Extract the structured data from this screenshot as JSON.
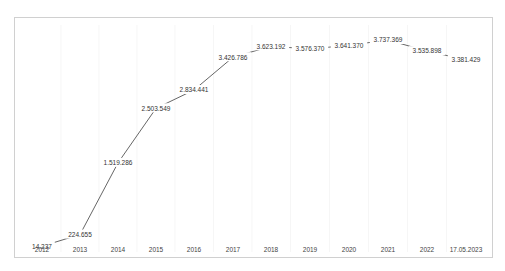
{
  "chart_data": {
    "type": "line",
    "title": "",
    "xlabel": "",
    "ylabel": "",
    "categories": [
      "2012",
      "2013",
      "2014",
      "2015",
      "2016",
      "2017",
      "2018",
      "2019",
      "2020",
      "2021",
      "2022",
      "17.05.2023"
    ],
    "series": [
      {
        "name": "",
        "values": [
          14237,
          224655,
          1519286,
          2503549,
          2834441,
          3426786,
          3623192,
          3576370,
          3641370,
          3737369,
          3535898,
          3381429
        ]
      }
    ],
    "data_labels": [
      "14.237",
      "224.655",
      "1.519.286",
      "2.503.549",
      "2.834.441",
      "3.426.786",
      "3.623.192",
      "3.576.370",
      "3.641.370",
      "3.737.369",
      "3.535.898",
      "3.381.429"
    ],
    "grid": "faint vertical gridlines",
    "legend": "none",
    "colors": {
      "line": "#555555",
      "border": "#d0d0d0",
      "gridline": "#f0f0f0"
    }
  }
}
